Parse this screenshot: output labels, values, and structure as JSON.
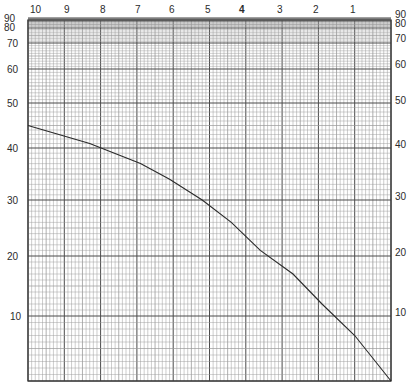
{
  "chart_data": {
    "type": "line",
    "title": "",
    "xlabel": "",
    "ylabel": "",
    "grid": true,
    "legend": null,
    "x_axis": {
      "position": "top",
      "direction": "descending-left-to-right",
      "ticks": [
        "10",
        "9",
        "8",
        "7",
        "6",
        "5",
        "4",
        "3",
        "2",
        "1"
      ],
      "range": [
        10,
        0
      ]
    },
    "y_axis": {
      "scale": "compressed-top (logarithmic-style)",
      "ticks_left": [
        "90",
        "80",
        "70",
        "60",
        "50",
        "40",
        "30",
        "20",
        "10"
      ],
      "ticks_right": [
        "90",
        "80",
        "70",
        "60",
        "50",
        "40",
        "30",
        "20",
        "10"
      ],
      "range": [
        0,
        100
      ]
    },
    "series": [
      {
        "name": "curve",
        "x": [
          10.0,
          8.3,
          6.9,
          6.1,
          5.2,
          4.4,
          3.6,
          2.7,
          1.9,
          1.0,
          0.0
        ],
        "y": [
          45,
          41,
          37,
          34,
          30,
          26,
          21,
          17,
          12,
          7,
          0
        ]
      }
    ]
  },
  "axes_text": {
    "top": [
      "10",
      "9",
      "8",
      "7",
      "6",
      "5",
      "4",
      "3",
      "2",
      "1"
    ],
    "left": [
      "90",
      "80",
      "70",
      "60",
      "50",
      "40",
      "30",
      "20",
      "10"
    ],
    "right": [
      "90",
      "80",
      "70",
      "60",
      "50",
      "40",
      "30",
      "20",
      "10"
    ]
  },
  "colors": {
    "paper": "#ffffff",
    "grid_minor": "#9a9a9a",
    "grid_major": "#4a4a4a",
    "curve": "#2a2a2a"
  }
}
